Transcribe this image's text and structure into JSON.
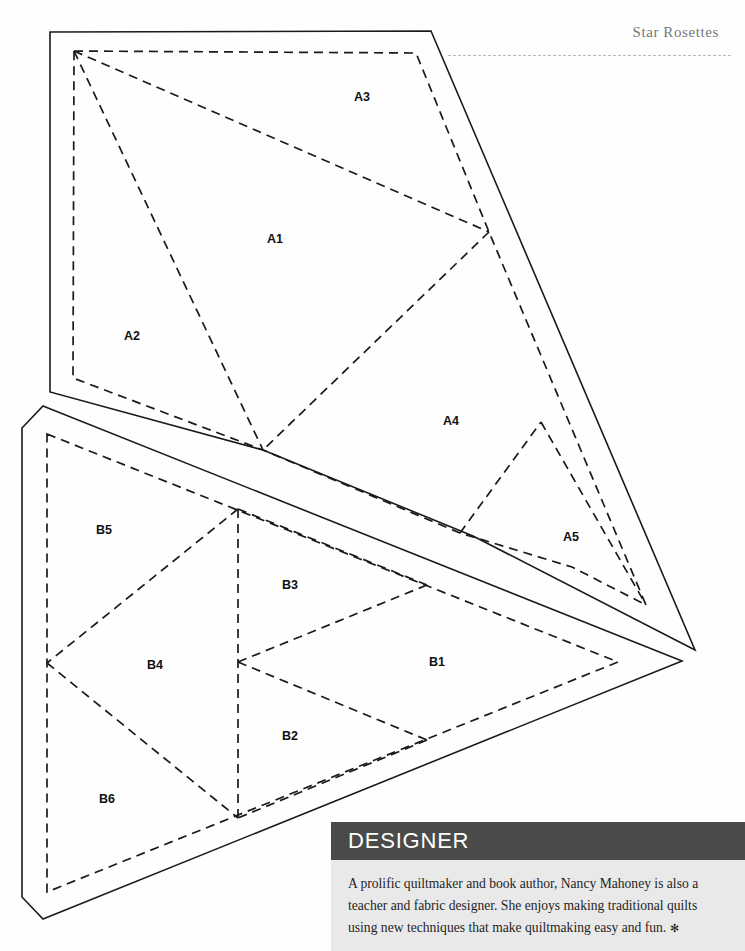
{
  "page": {
    "running_head": "Star Rosettes",
    "background_color": "#fefefe"
  },
  "pattern": {
    "title": "Star Rosettes foundation piecing pattern",
    "line_legend": {
      "cutting_line": "solid outer line",
      "stitching_line": "dashed inner line"
    },
    "units": [
      {
        "unit": "A",
        "labels": [
          "A1",
          "A2",
          "A3",
          "A4",
          "A5"
        ]
      },
      {
        "unit": "B",
        "labels": [
          "B1",
          "B2",
          "B3",
          "B4",
          "B5",
          "B6"
        ]
      }
    ],
    "labels": {
      "a1": "A1",
      "a2": "A2",
      "a3": "A3",
      "a4": "A4",
      "a5": "A5",
      "b1": "B1",
      "b2": "B2",
      "b3": "B3",
      "b4": "B4",
      "b5": "B5",
      "b6": "B6"
    },
    "colors": {
      "line": "#1a1a1a",
      "label": "#111111"
    }
  },
  "designer": {
    "heading": "DESIGNER",
    "body": "A prolific quiltmaker and book author, Nancy Mahoney is also a teacher and fabric designer. She enjoys making traditional quilts using new techniques that make quiltmaking easy and fun.",
    "end_mark": "✻",
    "header_color": "#4a4a4a",
    "body_color": "#e9e9e9"
  }
}
